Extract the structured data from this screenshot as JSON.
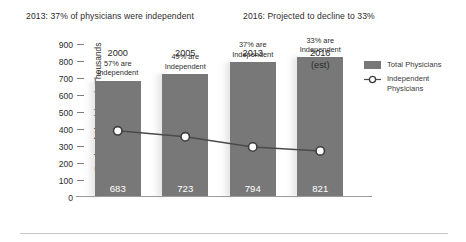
{
  "headlines": {
    "left": "2013: 37% of physicians were independent",
    "right": "2016: Projected to decline to 33%"
  },
  "legend": {
    "total_label": "Total Physicians",
    "independent_label_line1": "Independent",
    "independent_label_line2": "Physicians"
  },
  "colors": {
    "bar": "#787878",
    "line": "#4a4a4a",
    "axis": "#9a9a9a",
    "text": "#2b2b2b",
    "value_text": "#ffffff"
  },
  "chart_data": {
    "type": "bar",
    "title": "",
    "xlabel": "",
    "ylabel": "Total # of Physicians in Thousands",
    "ylim": [
      0,
      900
    ],
    "yticks": [
      900,
      800,
      700,
      600,
      500,
      400,
      300,
      200,
      100,
      0
    ],
    "ytick_labels": [
      "900",
      "800",
      "700",
      "600",
      "500",
      "400",
      "300",
      "200",
      "100",
      "0"
    ],
    "grid": false,
    "legend_position": "right",
    "categories": [
      "2000",
      "2005",
      "2013",
      "2016"
    ],
    "category_sublabels": [
      "",
      "",
      "",
      "(est)"
    ],
    "series": [
      {
        "name": "Total Physicians",
        "type": "bar",
        "values": [
          683,
          723,
          794,
          821
        ],
        "data_labels": [
          "683",
          "723",
          "794",
          "821"
        ]
      },
      {
        "name": "Independent Physicians",
        "type": "line",
        "values": [
          389,
          354,
          294,
          271
        ],
        "percent_labels": [
          "57% are Independent",
          "49% are Independent",
          "37% are Independent",
          "33% are Independent"
        ],
        "annotations": [
          "57% are\nIndependent",
          "49% are\nIndependent",
          "37% are\nIndependent",
          "33% are\nIndependent"
        ]
      }
    ],
    "annotations": [
      {
        "text": "57% are",
        "x": "2000"
      },
      {
        "text": "Independent",
        "x": "2000"
      },
      {
        "text": "49% are",
        "x": "2005"
      },
      {
        "text": "Independent",
        "x": "2005"
      },
      {
        "text": "37% are",
        "x": "2013"
      },
      {
        "text": "Independent",
        "x": "2013"
      },
      {
        "text": "33% are",
        "x": "2016"
      },
      {
        "text": "Independent",
        "x": "2016"
      }
    ]
  }
}
